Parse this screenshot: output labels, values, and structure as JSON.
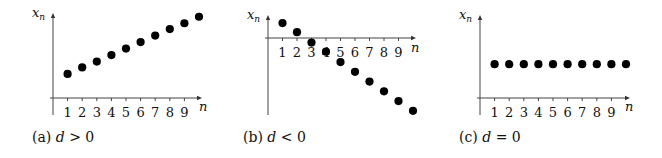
{
  "chart_data": [
    {
      "type": "scatter",
      "panel": "a",
      "caption": {
        "label": "(a)",
        "var": "d",
        "relation": ">",
        "value": "0"
      },
      "xlabel": "n",
      "ylabel": {
        "base": "x",
        "sub": "n"
      },
      "x": [
        1,
        2,
        3,
        4,
        5,
        6,
        7,
        8,
        9,
        10
      ],
      "x_tick_labels": [
        "1",
        "2",
        "3",
        "4",
        "5",
        "6",
        "7",
        "8",
        "9"
      ],
      "values": [
        3.7,
        4.7,
        5.6,
        6.6,
        7.6,
        8.6,
        9.6,
        10.6,
        11.5,
        12.5
      ],
      "description": "Arithmetic sequence with positive common difference: points increase linearly",
      "grid": false,
      "layout": {
        "origin_x": 53,
        "origin_y": 98,
        "x_step": 14.6,
        "y_scale": 6.5,
        "y_top": 13,
        "y_bottom": 115,
        "x_left": 50,
        "x_right": 202,
        "n_label": [
          199,
          107
        ],
        "caption_xy": [
          32,
          142
        ]
      }
    },
    {
      "type": "scatter",
      "panel": "b",
      "caption": {
        "label": "(b)",
        "var": "d",
        "relation": "<",
        "value": "0"
      },
      "xlabel": "n",
      "ylabel": {
        "base": "x",
        "sub": "n"
      },
      "x": [
        1,
        2,
        3,
        4,
        5,
        6,
        7,
        8,
        9,
        10
      ],
      "x_tick_labels": [
        "1",
        "2",
        "3",
        "4",
        "5",
        "6",
        "7",
        "8",
        "9"
      ],
      "values": [
        2.3,
        0.9,
        -0.7,
        -2.1,
        -3.7,
        -5.2,
        -6.7,
        -8.2,
        -9.7,
        -11.2
      ],
      "description": "Arithmetic sequence with negative common difference: points decrease linearly, crossing the n-axis near n=3",
      "grid": false,
      "layout": {
        "origin_x": 268,
        "origin_y": 38,
        "x_step": 14.5,
        "y_scale": 6.5,
        "y_top": 15,
        "y_bottom": 115,
        "x_left": 265,
        "x_right": 416,
        "n_label": [
          411,
          48
        ],
        "caption_xy": [
          243,
          142
        ]
      }
    },
    {
      "type": "scatter",
      "panel": "c",
      "caption": {
        "label": "(c)",
        "var": "d",
        "relation": "=",
        "value": "0"
      },
      "xlabel": "n",
      "ylabel": {
        "base": "x",
        "sub": "n"
      },
      "x": [
        1,
        2,
        3,
        4,
        5,
        6,
        7,
        8,
        9,
        10
      ],
      "x_tick_labels": [
        "1",
        "2",
        "3",
        "4",
        "5",
        "6",
        "7",
        "8",
        "9"
      ],
      "values": [
        5.2,
        5.2,
        5.2,
        5.2,
        5.2,
        5.2,
        5.2,
        5.2,
        5.2,
        5.2
      ],
      "description": "Constant sequence: common difference zero, all points at the same height",
      "grid": false,
      "layout": {
        "origin_x": 480,
        "origin_y": 98,
        "x_step": 14.6,
        "y_scale": 6.5,
        "y_top": 15,
        "y_bottom": 115,
        "x_left": 477,
        "x_right": 630,
        "n_label": [
          625,
          107
        ],
        "caption_xy": [
          459,
          142
        ]
      }
    }
  ]
}
